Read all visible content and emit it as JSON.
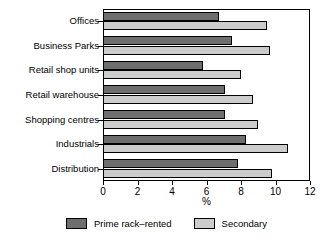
{
  "chart_data": {
    "type": "bar",
    "orientation": "horizontal",
    "title": "",
    "subtitle": "",
    "xlabel": "%",
    "ylabel": "",
    "xlim": [
      0,
      12
    ],
    "xticks": [
      0,
      2,
      4,
      6,
      8,
      10,
      12
    ],
    "xticklabels": [
      "0",
      "2",
      "4",
      "6",
      "8",
      "10",
      "12"
    ],
    "grid": false,
    "legend_position": "bottom",
    "categories": [
      "Offices",
      "Business Parks",
      "Retail shop units",
      "Retail warehouse",
      "Shopping centres",
      "Industrials",
      "Distribution"
    ],
    "series": [
      {
        "name": "Prime rack–rented",
        "color": "#6e6e6e",
        "values": [
          6.7,
          7.5,
          5.8,
          7.1,
          7.1,
          8.3,
          7.8
        ]
      },
      {
        "name": "Secondary",
        "color": "#cccccc",
        "values": [
          9.5,
          9.7,
          8.0,
          8.7,
          9.0,
          10.7,
          9.8
        ]
      }
    ]
  },
  "legend": {
    "items": [
      {
        "label": "Prime rack–rented",
        "swatch": "prime"
      },
      {
        "label": "Secondary",
        "swatch": "secondary"
      }
    ]
  },
  "colors": {
    "prime": "#6e6e6e",
    "secondary": "#cccccc",
    "axis": "#000000",
    "background": "#ffffff"
  }
}
